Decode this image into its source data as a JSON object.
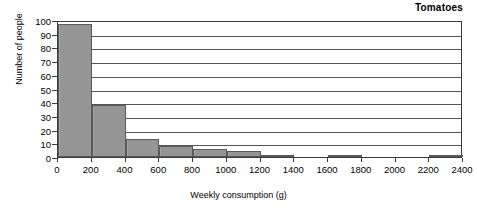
{
  "chart_data": {
    "type": "bar",
    "title": "Tomatoes",
    "xlabel": "Weekly consumption (g)",
    "ylabel": "Number of people",
    "xlim": [
      0,
      2400
    ],
    "ylim": [
      0,
      100
    ],
    "grid": true,
    "legend": "none",
    "bar_style": "histogram",
    "bin_width": 200,
    "xticks": [
      0,
      200,
      400,
      600,
      800,
      1000,
      1200,
      1400,
      1600,
      1800,
      2000,
      2200,
      2400
    ],
    "xtick_labels": [
      "0",
      "200",
      "400",
      "600",
      "800",
      "1000",
      "1200",
      "1400",
      "1600",
      "1800",
      "2000",
      "2200",
      "2400"
    ],
    "yticks": [
      0,
      10,
      20,
      30,
      40,
      50,
      60,
      70,
      80,
      90,
      100
    ],
    "ytick_labels": [
      "0",
      "10",
      "20",
      "30",
      "40",
      "50",
      "60",
      "70",
      "80",
      "90",
      "100"
    ],
    "categories": [
      "0-200",
      "200-400",
      "400-600",
      "600-800",
      "800-1000",
      "1000-1200",
      "1200-1400",
      "1600-1800",
      "2200-2400"
    ],
    "bin_starts": [
      0,
      200,
      400,
      600,
      800,
      1000,
      1200,
      1600,
      2200
    ],
    "bin_ends": [
      200,
      400,
      600,
      800,
      1000,
      1200,
      1400,
      1800,
      2400
    ],
    "values": [
      97,
      38,
      13,
      8,
      6,
      4.5,
      1,
      1,
      1
    ],
    "colors": {
      "bar_fill": "#9a9a9a",
      "bar_border": "#5a5a5a",
      "axis": "#3a3a3a",
      "gridline": "#555555",
      "text": "#000000",
      "background": "#ffffff"
    }
  }
}
